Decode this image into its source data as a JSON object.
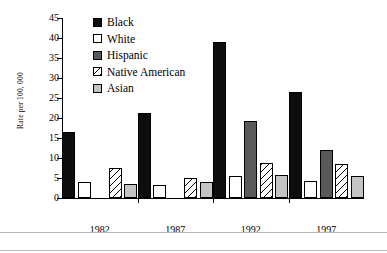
{
  "chart_data": {
    "type": "bar",
    "title": "",
    "xlabel": "",
    "ylabel": "Rate per 100, 000",
    "categories": [
      "1982",
      "1987",
      "1992",
      "1997"
    ],
    "ylim": [
      0,
      45
    ],
    "yticks": [
      0,
      5,
      10,
      15,
      20,
      25,
      30,
      35,
      40,
      45
    ],
    "grid": false,
    "legend_position": "top-left-inside",
    "series": [
      {
        "name": "Black",
        "swatch": "solid-black",
        "color": "#0d0d0d",
        "values": [
          16.5,
          21.3,
          39.0,
          26.4
        ]
      },
      {
        "name": "White",
        "swatch": "outline-white",
        "color": "#ffffff",
        "values": [
          3.9,
          3.2,
          5.5,
          4.2
        ]
      },
      {
        "name": "Hispanic",
        "swatch": "solid-dark-gray",
        "color": "#595959",
        "values": [
          null,
          null,
          19.3,
          12.0
        ]
      },
      {
        "name": "Native American",
        "swatch": "diagonal-hatch",
        "color": "#ffffff",
        "values": [
          7.6,
          4.9,
          8.8,
          8.4
        ]
      },
      {
        "name": "Asian",
        "swatch": "solid-light-gray",
        "color": "#c4c4c4",
        "values": [
          3.4,
          4.0,
          5.8,
          5.4
        ]
      }
    ]
  }
}
